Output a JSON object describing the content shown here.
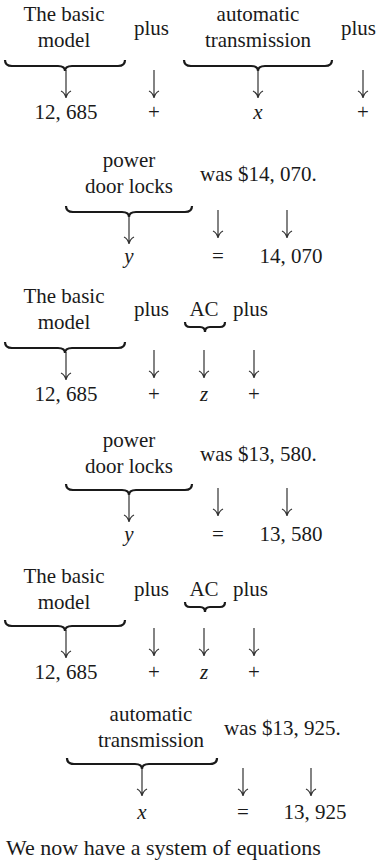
{
  "blocks": [
    {
      "id": "eq1a",
      "terms": [
        {
          "label_lines": [
            "The basic",
            "model"
          ],
          "value": "12, 685",
          "brace": true
        },
        {
          "label_lines": [
            "plus"
          ],
          "value": "+",
          "brace": false
        },
        {
          "label_lines": [
            "automatic",
            "transmission"
          ],
          "value": "x",
          "brace": true,
          "italic": true
        },
        {
          "label_lines": [
            "plus"
          ],
          "value": "+",
          "brace": false
        }
      ]
    },
    {
      "id": "eq1b",
      "terms": [
        {
          "label_lines": [
            "power",
            "door locks"
          ],
          "value": "y",
          "brace": true,
          "italic": true
        },
        {
          "label_lines": [
            "was $14, 070."
          ],
          "value": "=",
          "brace": false
        },
        {
          "label_lines": [
            ""
          ],
          "value": "14, 070",
          "brace": false
        }
      ]
    },
    {
      "id": "eq2a",
      "terms": [
        {
          "label_lines": [
            "The basic",
            "model"
          ],
          "value": "12, 685",
          "brace": true
        },
        {
          "label_lines": [
            "plus"
          ],
          "value": "+",
          "brace": false
        },
        {
          "label_lines": [
            "AC"
          ],
          "value": "z",
          "brace": true,
          "italic": true
        },
        {
          "label_lines": [
            "plus"
          ],
          "value": "+",
          "brace": false
        }
      ]
    },
    {
      "id": "eq2b",
      "terms": [
        {
          "label_lines": [
            "power",
            "door locks"
          ],
          "value": "y",
          "brace": true,
          "italic": true
        },
        {
          "label_lines": [
            "was $13, 580."
          ],
          "value": "=",
          "brace": false
        },
        {
          "label_lines": [
            ""
          ],
          "value": "13, 580",
          "brace": false
        }
      ]
    },
    {
      "id": "eq3a",
      "terms": [
        {
          "label_lines": [
            "The basic",
            "model"
          ],
          "value": "12, 685",
          "brace": true
        },
        {
          "label_lines": [
            "plus"
          ],
          "value": "+",
          "brace": false
        },
        {
          "label_lines": [
            "AC"
          ],
          "value": "z",
          "brace": true,
          "italic": true
        },
        {
          "label_lines": [
            "plus"
          ],
          "value": "+",
          "brace": false
        }
      ]
    },
    {
      "id": "eq3b",
      "terms": [
        {
          "label_lines": [
            "automatic",
            "transmission"
          ],
          "value": "x",
          "brace": true,
          "italic": true
        },
        {
          "label_lines": [
            "was $13, 925."
          ],
          "value": "=",
          "brace": false
        },
        {
          "label_lines": [
            ""
          ],
          "value": "13, 925",
          "brace": false
        }
      ]
    }
  ],
  "text": {
    "b1_basic1": "The basic",
    "b1_basic2": "model",
    "b1_plus1": "plus",
    "b1_auto1": "automatic",
    "b1_auto2": "transmission",
    "b1_plus2": "plus",
    "b1_v1": "12, 685",
    "b1_v2": "+",
    "b1_v3": "x",
    "b1_v4": "+",
    "b2_pw1": "power",
    "b2_pw2": "door locks",
    "b2_was": "was $14, 070.",
    "b2_v1": "y",
    "b2_v2": "=",
    "b2_v3": "14, 070",
    "b3_basic1": "The basic",
    "b3_basic2": "model",
    "b3_plus1": "plus",
    "b3_ac": "AC",
    "b3_plus2": "plus",
    "b3_v1": "12, 685",
    "b3_v2": "+",
    "b3_v3": "z",
    "b3_v4": "+",
    "b4_pw1": "power",
    "b4_pw2": "door locks",
    "b4_was": "was $13, 580.",
    "b4_v1": "y",
    "b4_v2": "=",
    "b4_v3": "13, 580",
    "b5_basic1": "The basic",
    "b5_basic2": "model",
    "b5_plus1": "plus",
    "b5_ac": "AC",
    "b5_plus2": "plus",
    "b5_v1": "12, 685",
    "b5_v2": "+",
    "b5_v3": "z",
    "b5_v4": "+",
    "b6_at1": "automatic",
    "b6_at2": "transmission",
    "b6_was": "was $13, 925.",
    "b6_v1": "x",
    "b6_v2": "=",
    "b6_v3": "13, 925",
    "footer": "We now have a system of equations"
  }
}
